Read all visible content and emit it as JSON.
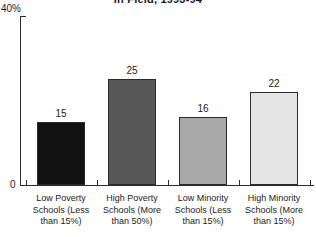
{
  "chart_data": {
    "type": "bar",
    "title": "in Field, 1993-94",
    "xlabel": "",
    "ylabel": "",
    "ylim": [
      0,
      40
    ],
    "y_tick_labels": [
      "0",
      "40%"
    ],
    "grid": false,
    "legend": "none",
    "categories": [
      "Low Poverty Schools (Less than 15%)",
      "High Poverty Schools (More than 50%)",
      "Low Minority Schools (Less than 15%)",
      "High Minority Schools (More than 15%)"
    ],
    "category_lines": [
      [
        "Low Poverty",
        "Schools (Less",
        "than 15%)"
      ],
      [
        "High Poverty",
        "Schools (More",
        "than 50%)"
      ],
      [
        "Low Minority",
        "Schools (Less",
        "than 15%)"
      ],
      [
        "High Minority",
        "Schools (More",
        "than 15%)"
      ]
    ],
    "values": [
      15,
      25,
      16,
      22
    ],
    "value_labels": [
      "15",
      "25",
      "16",
      "22"
    ],
    "bar_colors": [
      "#111111",
      "#585858",
      "#a8a8a8",
      "#e5e5e5"
    ],
    "bar_edge_color": "#2b2b2b",
    "axis_color": "#2b2b2b",
    "background_color": "#ffffff",
    "text_color": "#1b1b1b"
  },
  "axis": {
    "y_max_label": "40%",
    "y_min_label": "0"
  }
}
